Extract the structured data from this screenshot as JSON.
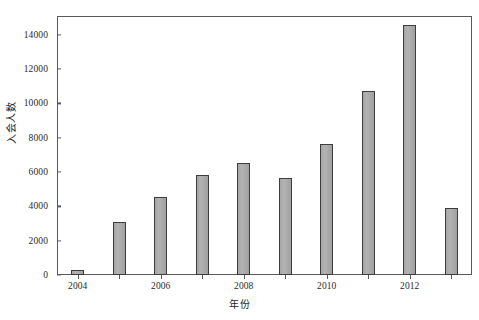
{
  "chart_data": {
    "type": "bar",
    "title": "",
    "subtitle": "",
    "xlabel": "年份",
    "ylabel": "入会人数",
    "categories": [
      "2004",
      "2005",
      "2006",
      "2007",
      "2008",
      "2009",
      "2010",
      "2011",
      "2012",
      "2013"
    ],
    "values": [
      300,
      3100,
      4550,
      5850,
      6550,
      5650,
      7650,
      10700,
      14550,
      3900
    ],
    "series": [
      {
        "name": "入会人数",
        "values": [
          300,
          3100,
          4550,
          5850,
          6550,
          5650,
          7650,
          10700,
          14550,
          3900
        ]
      }
    ],
    "ylim": [
      0,
      15100
    ],
    "xlim_labels": [
      "2004",
      "2013"
    ],
    "yticks": [
      0,
      2000,
      4000,
      6000,
      8000,
      10000,
      12000,
      14000
    ],
    "ytick_labels": [
      "0",
      "2000",
      "4000",
      "6000",
      "8000",
      "10000",
      "12000",
      "14000"
    ],
    "xticks": [
      "2004",
      "2006",
      "2008",
      "2010",
      "2012"
    ],
    "xtick_labels": [
      "2004",
      "2006",
      "2008",
      "2010",
      "2012"
    ],
    "grid": false,
    "legend": false,
    "legend_position": "none",
    "annotations": [],
    "colors": {
      "bar_fill": "#a8a8a8",
      "bar_edge": "#3d3d3d",
      "frame": "#5a5a5a",
      "text": "#1e1e1e",
      "background": "#ffffff"
    }
  },
  "axes": {
    "y_label": "入会人数",
    "x_label": "年份"
  }
}
